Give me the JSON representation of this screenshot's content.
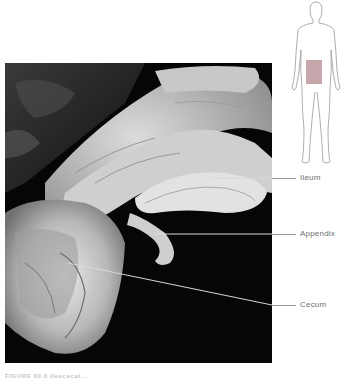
{
  "figure": {
    "photo_alt": "Dissected ileocecal region showing ileum, appendix and cecum",
    "labels": [
      {
        "id": "ileum",
        "text": "Ileum"
      },
      {
        "id": "appendix",
        "text": "Appendix"
      },
      {
        "id": "cecum",
        "text": "Cecum"
      }
    ],
    "locator": {
      "highlight_color": "#b38a8f",
      "outline_color": "#9a9a9a"
    },
    "caption": "FIGURE 00.0 Ileocecal..."
  }
}
